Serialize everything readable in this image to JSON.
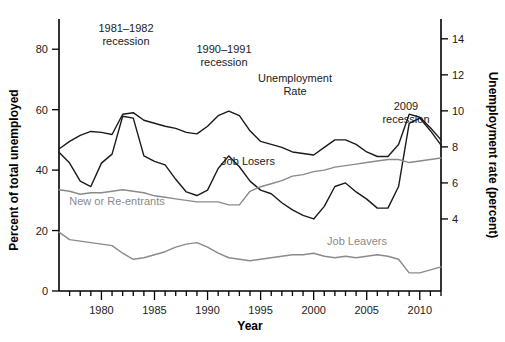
{
  "figure": {
    "background": "#ffffff",
    "x_axis_title": "Year",
    "y_left_title": "Percent of total unemployed",
    "y_right_title": "Unemployment rate (percent)"
  },
  "annotations": [
    {
      "name": "recession-1981-1982",
      "line1": "1981–1982",
      "line2": "recession",
      "x": 126,
      "y": 32
    },
    {
      "name": "recession-1990-1991",
      "line1": "1990–1991",
      "line2": "recession",
      "x": 224,
      "y": 53
    },
    {
      "name": "recession-2009",
      "line1": "2009",
      "line2": "recession",
      "x": 406,
      "y": 110
    }
  ],
  "series_labels": [
    {
      "name": "unemployment-rate-label",
      "line1": "Unemployment",
      "line2": "Rate",
      "x": 295,
      "y": 82,
      "color": "#1a1a1a"
    },
    {
      "name": "job-losers-label",
      "text": "Job Losers",
      "x": 248,
      "y": 165,
      "color": "#1a1a1a"
    },
    {
      "name": "new-or-re-entrants-label",
      "text": "New or Re-entrants",
      "x": 117,
      "y": 205,
      "color": "#8a8a8a"
    },
    {
      "name": "job-leavers-label",
      "text": "Job Leavers",
      "x": 357,
      "y": 245,
      "color": "#8a8a8a"
    }
  ],
  "chart_data": {
    "type": "line",
    "title": "",
    "xlabel": "Year",
    "ylabel": "Percent of total unemployed",
    "y2label": "Unemployment rate (percent)",
    "xlim": [
      1976,
      2012
    ],
    "ylim": [
      0,
      90
    ],
    "y2lim": [
      0,
      15.1
    ],
    "grid": false,
    "legend": "inline-annotations",
    "y_ticks": [
      0,
      20,
      40,
      60,
      80
    ],
    "y_ticklabels": [
      "0",
      "20",
      "40",
      "60",
      "80"
    ],
    "y2_ticks": [
      4,
      6,
      8,
      10,
      12,
      14
    ],
    "y2_ticklabels": [
      "4",
      "6",
      "8",
      "10",
      "12",
      "14"
    ],
    "x_major_ticks": [
      1980,
      1985,
      1990,
      1995,
      2000,
      2005,
      2010
    ],
    "x_ticklabels": [
      "1980",
      "1985",
      "1990",
      "1995",
      "2000",
      "2005",
      "2010"
    ],
    "x_minor_ticks": [
      1977,
      1978,
      1979,
      1981,
      1982,
      1983,
      1984,
      1986,
      1987,
      1988,
      1989,
      1991,
      1992,
      1993,
      1994,
      1996,
      1997,
      1998,
      1999,
      2001,
      2002,
      2003,
      2004,
      2006,
      2007,
      2008,
      2009,
      2011,
      2012
    ],
    "x": [
      1976,
      1977,
      1978,
      1979,
      1980,
      1981,
      1982,
      1983,
      1984,
      1985,
      1986,
      1987,
      1988,
      1989,
      1990,
      1991,
      1992,
      1993,
      1994,
      1995,
      1996,
      1997,
      1998,
      1999,
      2000,
      2001,
      2002,
      2003,
      2004,
      2005,
      2006,
      2007,
      2008,
      2009,
      2010,
      2011,
      2012
    ],
    "series": [
      {
        "name": "Unemployment Rate",
        "axis": "right",
        "color": "#1a1a1a",
        "width": 1.4,
        "units": "percent",
        "values": [
          7.7,
          7.1,
          6.1,
          5.8,
          7.1,
          7.6,
          9.7,
          9.6,
          7.5,
          7.2,
          7.0,
          6.2,
          5.5,
          5.3,
          5.6,
          6.8,
          7.5,
          6.9,
          6.1,
          5.6,
          5.4,
          4.9,
          4.5,
          4.2,
          4.0,
          4.7,
          5.8,
          6.0,
          5.5,
          5.1,
          4.6,
          4.6,
          5.8,
          9.3,
          9.6,
          8.9,
          8.1
        ]
      },
      {
        "name": "Job Losers",
        "axis": "left",
        "color": "#1a1a1a",
        "width": 1.4,
        "units": "percent of total unemployed",
        "values": [
          47.0,
          49.5,
          51.5,
          52.8,
          52.5,
          51.8,
          58.5,
          59.0,
          56.5,
          55.5,
          54.5,
          53.8,
          52.5,
          52.0,
          54.5,
          58.0,
          59.5,
          58.0,
          53.0,
          49.5,
          48.5,
          47.5,
          46.0,
          45.5,
          45.0,
          47.5,
          50.0,
          50.0,
          48.5,
          46.0,
          44.5,
          44.5,
          48.5,
          58.5,
          57.5,
          54.0,
          50.0
        ]
      },
      {
        "name": "New or Re-entrants",
        "axis": "left",
        "color": "#8a8a8a",
        "width": 1.4,
        "units": "percent of total unemployed",
        "values": [
          33.5,
          33.0,
          32.0,
          32.5,
          32.5,
          33.0,
          33.5,
          33.0,
          32.5,
          31.5,
          31.0,
          30.5,
          30.0,
          29.5,
          29.5,
          29.5,
          28.5,
          28.5,
          33.0,
          34.5,
          35.5,
          36.5,
          38.0,
          38.5,
          39.5,
          40.0,
          41.0,
          41.5,
          42.0,
          42.5,
          43.0,
          43.5,
          43.5,
          42.5,
          43.0,
          43.5,
          44.0
        ]
      },
      {
        "name": "Job Leavers",
        "axis": "left",
        "color": "#8a8a8a",
        "width": 1.4,
        "units": "percent of total unemployed",
        "values": [
          19.5,
          17.0,
          16.5,
          16.0,
          15.5,
          15.0,
          12.5,
          10.5,
          11.0,
          12.0,
          13.0,
          14.5,
          15.5,
          16.0,
          14.5,
          12.5,
          11.0,
          10.5,
          10.0,
          10.5,
          11.0,
          11.5,
          12.0,
          12.0,
          12.5,
          11.5,
          11.0,
          11.5,
          11.0,
          11.5,
          12.0,
          11.5,
          10.5,
          6.0,
          6.0,
          7.0,
          8.0
        ]
      }
    ]
  }
}
